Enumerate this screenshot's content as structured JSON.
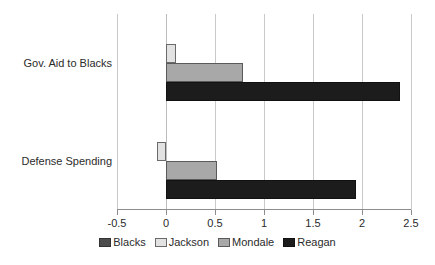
{
  "chart_data": {
    "type": "bar",
    "orientation": "horizontal",
    "title": "",
    "xlabel": "",
    "ylabel": "",
    "categories": [
      "Gov. Aid to Blacks",
      "Defense Spending"
    ],
    "series": [
      {
        "name": "Blacks",
        "values": [
          0.0,
          0.0
        ],
        "color": "#4d4d4d"
      },
      {
        "name": "Jackson",
        "values": [
          0.1,
          -0.09
        ],
        "color": "#e2e2e2"
      },
      {
        "name": "Mondale",
        "values": [
          0.79,
          0.52
        ],
        "color": "#a8a8a8"
      },
      {
        "name": "Reagan",
        "values": [
          2.39,
          1.94
        ],
        "color": "#1c1c1c"
      }
    ],
    "xlim": [
      -0.5,
      2.5
    ],
    "xticks": [
      -0.5,
      0,
      0.5,
      1,
      1.5,
      2,
      2.5
    ],
    "xtick_labels": [
      "-0.5",
      "0",
      "0.5",
      "1",
      "1.5",
      "2",
      "2.5"
    ],
    "grid": true,
    "grid_axis": "x",
    "legend_position": "bottom",
    "legend_entries": [
      "Blacks",
      "Jackson",
      "Mondale",
      "Reagan"
    ]
  }
}
